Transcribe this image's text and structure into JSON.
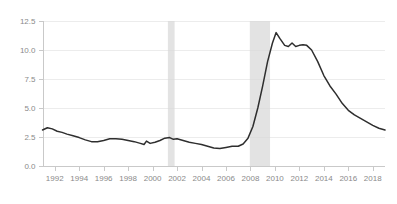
{
  "chart_data": {
    "type": "line",
    "title": "",
    "subtitle": "",
    "xlabel": "",
    "ylabel": "",
    "xlim": [
      1991.0,
      2019.0
    ],
    "ylim": [
      0.0,
      12.5
    ],
    "grid": true,
    "legend_position": "none",
    "y_ticks": [
      0.0,
      2.5,
      5.0,
      7.5,
      10.0,
      12.5
    ],
    "y_tick_labels": [
      "0.0",
      "2.5",
      "5.0",
      "7.5",
      "10.0",
      "12.5"
    ],
    "x_ticks": [
      1992,
      1994,
      1996,
      1998,
      2000,
      2002,
      2004,
      2006,
      2008,
      2010,
      2012,
      2014,
      2016,
      2018
    ],
    "x_tick_labels": [
      "1992",
      "1994",
      "1996",
      "1998",
      "2000",
      "2002",
      "2004",
      "2006",
      "2008",
      "2010",
      "2012",
      "2014",
      "2016",
      "2018"
    ],
    "series": [
      {
        "name": "rate",
        "color": "#2e2e2e",
        "x": [
          1991.0,
          1991.4,
          1991.8,
          1992.2,
          1992.6,
          1993.0,
          1993.5,
          1994.0,
          1994.5,
          1995.0,
          1995.5,
          1996.0,
          1996.5,
          1997.0,
          1997.5,
          1998.0,
          1998.5,
          1999.0,
          1999.3,
          1999.5,
          1999.8,
          2000.2,
          2000.6,
          2001.0,
          2001.4,
          2001.7,
          2002.0,
          2002.5,
          2003.0,
          2003.5,
          2004.0,
          2004.5,
          2005.0,
          2005.5,
          2006.0,
          2006.5,
          2007.0,
          2007.4,
          2007.8,
          2008.2,
          2008.6,
          2009.0,
          2009.4,
          2009.8,
          2010.1,
          2010.4,
          2010.8,
          2011.1,
          2011.4,
          2011.7,
          2012.0,
          2012.3,
          2012.6,
          2013.0,
          2013.5,
          2014.0,
          2014.5,
          2015.0,
          2015.5,
          2016.0,
          2016.5,
          2017.0,
          2017.5,
          2018.0,
          2018.5,
          2019.0
        ],
        "y": [
          3.1,
          3.3,
          3.2,
          3.0,
          2.9,
          2.75,
          2.6,
          2.45,
          2.25,
          2.1,
          2.1,
          2.2,
          2.35,
          2.35,
          2.3,
          2.2,
          2.1,
          1.95,
          1.85,
          2.15,
          1.95,
          2.05,
          2.2,
          2.4,
          2.45,
          2.3,
          2.35,
          2.2,
          2.05,
          1.95,
          1.85,
          1.7,
          1.55,
          1.5,
          1.6,
          1.7,
          1.7,
          1.9,
          2.4,
          3.4,
          5.0,
          6.9,
          9.0,
          10.6,
          11.5,
          11.0,
          10.4,
          10.3,
          10.6,
          10.3,
          10.4,
          10.45,
          10.4,
          10.0,
          9.0,
          7.8,
          6.9,
          6.2,
          5.4,
          4.8,
          4.4,
          4.1,
          3.8,
          3.5,
          3.25,
          3.1
        ]
      }
    ],
    "shaded_regions": [
      {
        "label": "recession-2001",
        "x_start": 2001.25,
        "x_end": 2001.8,
        "color": "#d9d9d9"
      },
      {
        "label": "recession-2008",
        "x_start": 2007.95,
        "x_end": 2009.6,
        "color": "#d9d9d9"
      }
    ],
    "colors": {
      "line": "#2e2e2e",
      "grid": "#ececec",
      "axis": "#c9c9c9",
      "tick_text": "#8a8a8a",
      "shading": "#d9d9d9",
      "background": "#ffffff"
    }
  }
}
